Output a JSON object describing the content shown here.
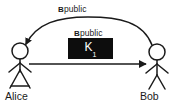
{
  "diagram": {
    "background_color": "#ffffff",
    "stroke_color": "#1a1a1a",
    "box_fill_color": "#0d0d0d",
    "box_text_color": "#ffffff",
    "actors": [
      {
        "id": "alice",
        "name": "Alice",
        "figure": "stick-figure-skirt",
        "head_center": {
          "x": 20,
          "y": 51
        },
        "head_radius": 8
      },
      {
        "id": "bob",
        "name": "Bob",
        "figure": "stick-figure-legs",
        "head_center": {
          "x": 157,
          "y": 52
        },
        "head_radius": 8
      }
    ],
    "messages": [
      {
        "id": "curved-message",
        "label_bold": "B",
        "label_rest": "public",
        "from": "bob",
        "to": "alice",
        "shape": "curved-arc",
        "direction": "right-to-left",
        "arrowhead": "at-alice"
      },
      {
        "id": "straight-message",
        "label_bold": "B",
        "label_rest": "public",
        "from": "alice",
        "to": "bob",
        "shape": "straight-line",
        "direction": "left-to-right",
        "arrowhead": "at-bob",
        "payload": {
          "symbol": "K",
          "subscript": "1",
          "display": "K1"
        }
      }
    ]
  }
}
